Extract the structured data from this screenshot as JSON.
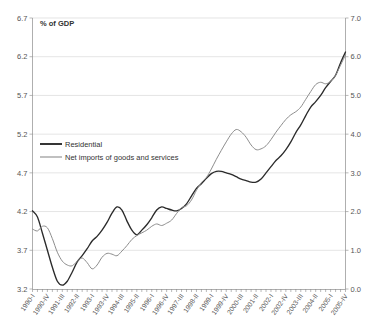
{
  "chart_data": {
    "type": "line",
    "title": "",
    "unit_label": "% of GDP",
    "xlabel": "",
    "ylabel": "",
    "ylim": [
      3.2,
      6.7
    ],
    "ylim_right": [
      0.0,
      7.0
    ],
    "grid": true,
    "legend_position": "inside-upper-left",
    "y_ticks_left": [
      "6.7",
      "6.2",
      "5.7",
      "5.2",
      "4.7",
      "4.2",
      "3.7",
      "3.2"
    ],
    "y_ticks_right": [
      "7.0",
      "6.0",
      "5.0",
      "4.0",
      "3.0",
      "2.0",
      "1.0",
      "0.0"
    ],
    "x_tick_labels": [
      "1990-I",
      "1990-IV",
      "1991-III",
      "1992-II",
      "1993-I",
      "1993-IV",
      "1994-III",
      "1995-II",
      "1996-I",
      "1996-IV",
      "1997-III",
      "1998-II",
      "1999-I",
      "1999-IV",
      "2000-III",
      "2001-II",
      "2002-I",
      "2002-IV",
      "2003-III",
      "2004-II",
      "2005-I",
      "2005-IV"
    ],
    "x_quarters": [
      "1990-I",
      "1990-II",
      "1990-III",
      "1990-IV",
      "1991-I",
      "1991-II",
      "1991-III",
      "1991-IV",
      "1992-I",
      "1992-II",
      "1992-III",
      "1992-IV",
      "1993-I",
      "1993-II",
      "1993-III",
      "1993-IV",
      "1994-I",
      "1994-II",
      "1994-III",
      "1994-IV",
      "1995-I",
      "1995-II",
      "1995-III",
      "1995-IV",
      "1996-I",
      "1996-II",
      "1996-III",
      "1996-IV",
      "1997-I",
      "1997-II",
      "1997-III",
      "1997-IV",
      "1998-I",
      "1998-II",
      "1998-III",
      "1998-IV",
      "1999-I",
      "1999-II",
      "1999-III",
      "1999-IV",
      "2000-I",
      "2000-II",
      "2000-III",
      "2000-IV",
      "2001-I",
      "2001-II",
      "2001-III",
      "2001-IV",
      "2002-I",
      "2002-II",
      "2002-III",
      "2002-IV",
      "2003-I",
      "2003-II",
      "2003-III",
      "2003-IV",
      "2004-I",
      "2004-II",
      "2004-III",
      "2004-IV",
      "2005-I",
      "2005-II",
      "2005-III",
      "2005-IV"
    ],
    "series": [
      {
        "name": "Residential",
        "color": "#2b2b2b",
        "axis": "left",
        "values": [
          4.21,
          4.13,
          3.92,
          3.7,
          3.48,
          3.3,
          3.25,
          3.3,
          3.42,
          3.55,
          3.63,
          3.72,
          3.82,
          3.88,
          3.96,
          4.06,
          4.18,
          4.26,
          4.22,
          4.08,
          3.96,
          3.9,
          3.96,
          4.03,
          4.12,
          4.22,
          4.26,
          4.24,
          4.22,
          4.21,
          4.24,
          4.3,
          4.4,
          4.5,
          4.56,
          4.63,
          4.69,
          4.72,
          4.72,
          4.7,
          4.68,
          4.65,
          4.62,
          4.6,
          4.58,
          4.58,
          4.62,
          4.7,
          4.78,
          4.86,
          4.92,
          5.0,
          5.1,
          5.22,
          5.32,
          5.44,
          5.55,
          5.62,
          5.7,
          5.8,
          5.88,
          5.96,
          6.12,
          6.26
        ]
      },
      {
        "name": "Net imports of goods and services",
        "color": "#8d8d8d",
        "axis": "right",
        "values": [
          1.55,
          1.5,
          1.62,
          1.58,
          1.3,
          0.95,
          0.72,
          0.62,
          0.6,
          0.72,
          0.8,
          0.68,
          0.52,
          0.62,
          0.82,
          0.92,
          0.9,
          0.86,
          0.98,
          1.12,
          1.28,
          1.38,
          1.45,
          1.52,
          1.62,
          1.68,
          1.64,
          1.7,
          1.78,
          1.95,
          2.1,
          2.15,
          2.3,
          2.55,
          2.75,
          2.88,
          3.1,
          3.35,
          3.58,
          3.8,
          4.0,
          4.12,
          4.06,
          3.92,
          3.72,
          3.6,
          3.62,
          3.7,
          3.86,
          4.05,
          4.22,
          4.38,
          4.5,
          4.58,
          4.7,
          4.9,
          5.1,
          5.28,
          5.34,
          5.3,
          5.36,
          5.52,
          5.78,
          6.05
        ]
      }
    ]
  },
  "legend": {
    "items": [
      {
        "label": "Residential",
        "color": "#2b2b2b"
      },
      {
        "label": "Net imports of goods and services",
        "color": "#8d8d8d"
      }
    ]
  }
}
